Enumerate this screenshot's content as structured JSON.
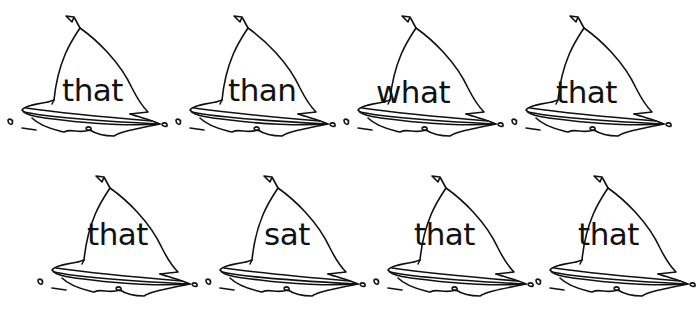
{
  "worksheet": {
    "boats": [
      {
        "word": "that",
        "x": 2,
        "y": 0,
        "wx": 60,
        "wy": 72
      },
      {
        "word": "than",
        "x": 170,
        "y": 0,
        "wx": 58,
        "wy": 72
      },
      {
        "word": "what",
        "x": 338,
        "y": 0,
        "wx": 38,
        "wy": 74
      },
      {
        "word": "that",
        "x": 506,
        "y": 0,
        "wx": 50,
        "wy": 74
      },
      {
        "word": "that",
        "x": 32,
        "y": 160,
        "wx": 55,
        "wy": 56
      },
      {
        "word": "sat",
        "x": 200,
        "y": 160,
        "wx": 64,
        "wy": 56
      },
      {
        "word": "that",
        "x": 368,
        "y": 160,
        "wx": 46,
        "wy": 56
      },
      {
        "word": "that",
        "x": 530,
        "y": 160,
        "wx": 48,
        "wy": 56
      }
    ],
    "colors": {
      "ink": "#111111",
      "background": "#ffffff"
    }
  }
}
